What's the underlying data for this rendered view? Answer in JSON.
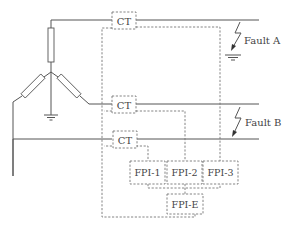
{
  "diagram": {
    "type": "three-phase fault indicator wiring",
    "ct_boxes": [
      {
        "label": "CT"
      },
      {
        "label": "CT"
      },
      {
        "label": "CT"
      }
    ],
    "fault_labels": [
      {
        "label": "Fault A"
      },
      {
        "label": "Fault B"
      }
    ],
    "fpi_boxes": [
      {
        "label": "FPI-1"
      },
      {
        "label": "FPI-2"
      },
      {
        "label": "FPI-3"
      },
      {
        "label": "FPI-E"
      }
    ]
  }
}
